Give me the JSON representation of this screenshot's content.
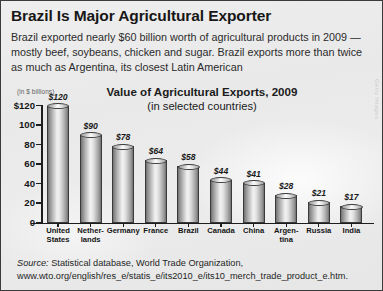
{
  "article": {
    "headline": "Brazil Is Major Agricultural Exporter",
    "deck": "Brazil exported nearly $60 billion worth of agricultural products in 2009 — mostly beef, soybeans, chicken and sugar. Brazil exports more than twice as much as Argentina, its closest Latin American"
  },
  "watermark": "Getty Images",
  "source": {
    "label": "Source:",
    "text": "Statistical database, World Trade Organization,",
    "url": "www.wto.org/english/res_e/statis_e/its2010_e/its10_merch_trade_product_e.htm."
  },
  "colors": {
    "background": "#ebebeb",
    "axis": "#1d1d1d",
    "text": "#171717",
    "bar_light": "#f2f2f2",
    "bar_dark": "#6f6f6f"
  },
  "chart_data": {
    "type": "bar",
    "title": "Value of Agricultural Exports, 2009",
    "subtitle": "(in selected countries)",
    "units_note": "(in $ billions)",
    "xlabel": "",
    "ylabel": "",
    "ylim": [
      0,
      120
    ],
    "grid": false,
    "legend": "none",
    "ytick_labels": [
      "$120",
      "100",
      "80",
      "60",
      "40",
      "20",
      "0"
    ],
    "ytick_values": [
      120,
      100,
      80,
      60,
      40,
      20,
      0
    ],
    "categories": [
      "United States",
      "Netherlands",
      "Germany",
      "France",
      "Brazil",
      "Canada",
      "China",
      "Argentina",
      "Russia",
      "India"
    ],
    "category_labels": [
      [
        "United",
        "States"
      ],
      [
        "Nether-",
        "lands"
      ],
      [
        "Germany",
        ""
      ],
      [
        "France",
        ""
      ],
      [
        "Brazil",
        ""
      ],
      [
        "Canada",
        ""
      ],
      [
        "China",
        ""
      ],
      [
        "Argen-",
        "tina"
      ],
      [
        "Russia",
        ""
      ],
      [
        "India",
        ""
      ]
    ],
    "values": [
      120,
      90,
      78,
      64,
      58,
      44,
      41,
      28,
      21,
      17
    ],
    "data_labels": [
      "$120",
      "$90",
      "$78",
      "$64",
      "$58",
      "$44",
      "$41",
      "$28",
      "$21",
      "$17"
    ]
  }
}
